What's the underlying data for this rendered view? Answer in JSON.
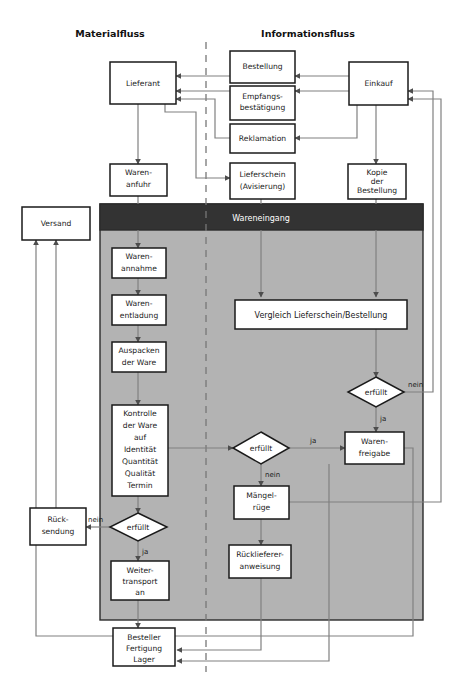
{
  "figure": {
    "type": "flowchart",
    "language": "de",
    "title_left": "Materialfluss",
    "title_right": "Informationsfluss",
    "swimlane_title": "Wareneingang",
    "colors": {
      "lane_header_fill": "#333333",
      "lane_header_text": "#ffffff",
      "lane_body_fill": "#b3b3b3",
      "node_fill": "#ffffff",
      "node_stroke": "#1a1a1a",
      "connector_stroke": "#7f7f7f",
      "page_background": "#ffffff"
    }
  },
  "columns": {
    "left": {
      "label": "Materialfluss"
    },
    "right": {
      "label": "Informationsfluss"
    }
  },
  "lane": {
    "label": "Wareneingang"
  },
  "nodes": [
    {
      "id": "lieferant",
      "label": "Lieferant",
      "shape": "box"
    },
    {
      "id": "warenanfuhr",
      "label": "Waren-\nanfuhr",
      "shape": "box"
    },
    {
      "id": "versand",
      "label": "Versand",
      "shape": "box"
    },
    {
      "id": "bestellung",
      "label": "Bestellung",
      "shape": "box"
    },
    {
      "id": "empfang",
      "label": "Empfangs-\nbestätigung",
      "shape": "box"
    },
    {
      "id": "reklamation",
      "label": "Reklamation",
      "shape": "box"
    },
    {
      "id": "lieferschein",
      "label": "Lieferschein\n(Avisierung)",
      "shape": "box"
    },
    {
      "id": "einkauf",
      "label": "Einkauf",
      "shape": "box"
    },
    {
      "id": "kopie",
      "label": "Kopie\nder\nBestellung",
      "shape": "box"
    },
    {
      "id": "warenannahme",
      "label": "Waren-\nannahme",
      "shape": "box"
    },
    {
      "id": "warenentladung",
      "label": "Waren-\nentladung",
      "shape": "box"
    },
    {
      "id": "auspacken",
      "label": "Auspacken\nder Ware",
      "shape": "box"
    },
    {
      "id": "kontrolle",
      "label": "Kontrolle\nder Ware\nauf\nIdentität\nQuantität\nQualität\nTermin",
      "shape": "box"
    },
    {
      "id": "vergleich",
      "label": "Vergleich Lieferschein/Bestellung",
      "shape": "box"
    },
    {
      "id": "erfuellt_oben",
      "label": "erfüllt",
      "shape": "diamond"
    },
    {
      "id": "erfuellt_mitte",
      "label": "erfüllt",
      "shape": "diamond"
    },
    {
      "id": "erfuellt_links",
      "label": "erfüllt",
      "shape": "diamond"
    },
    {
      "id": "warenfreigabe",
      "label": "Waren-\nfreigabe",
      "shape": "box"
    },
    {
      "id": "maengelruege",
      "label": "Mängel-\nrüge",
      "shape": "box"
    },
    {
      "id": "rucklieferung",
      "label": "Rücklieferer-\nanweisung",
      "shape": "box"
    },
    {
      "id": "ruecksendung",
      "label": "Rück-\nsendung",
      "shape": "box"
    },
    {
      "id": "weitertransport",
      "label": "Weiter-\ntransport\nan",
      "shape": "box"
    },
    {
      "id": "besteller",
      "label": "Besteller\nFertigung\nLager",
      "shape": "box"
    }
  ],
  "node_text": {
    "lieferant": "Lieferant",
    "warenanfuhr_1": "Waren-",
    "warenanfuhr_2": "anfuhr",
    "versand": "Versand",
    "bestellung": "Bestellung",
    "empfang_1": "Empfangs-",
    "empfang_2": "bestätigung",
    "reklamation": "Reklamation",
    "lieferschein_1": "Lieferschein",
    "lieferschein_2": "(Avisierung)",
    "einkauf": "Einkauf",
    "kopie_1": "Kopie",
    "kopie_2": "der",
    "kopie_3": "Bestellung",
    "warenannahme_1": "Waren-",
    "warenannahme_2": "annahme",
    "warenentladung_1": "Waren-",
    "warenentladung_2": "entladung",
    "auspacken_1": "Auspacken",
    "auspacken_2": "der Ware",
    "kontrolle_1": "Kontrolle",
    "kontrolle_2": "der Ware",
    "kontrolle_3": "auf",
    "kontrolle_4": "Identität",
    "kontrolle_5": "Quantität",
    "kontrolle_6": "Qualität",
    "kontrolle_7": "Termin",
    "vergleich": "Vergleich Lieferschein/Bestellung",
    "erfuellt_oben": "erfüllt",
    "erfuellt_mitte": "erfüllt",
    "erfuellt_links": "erfüllt",
    "warenfreigabe_1": "Waren-",
    "warenfreigabe_2": "freigabe",
    "maengelruege_1": "Mängel-",
    "maengelruege_2": "rüge",
    "rucklieferung_1": "Rücklieferer-",
    "rucklieferung_2": "anweisung",
    "ruecksendung_1": "Rück-",
    "ruecksendung_2": "sendung",
    "weitertransport_1": "Weiter-",
    "weitertransport_2": "transport",
    "weitertransport_3": "an",
    "besteller_1": "Besteller",
    "besteller_2": "Fertigung",
    "besteller_3": "Lager"
  },
  "edge_labels": {
    "oben_nein": "nein",
    "oben_ja": "ja",
    "mitte_ja": "ja",
    "mitte_nein": "nein",
    "links_nein": "nein",
    "links_ja": "ja"
  },
  "edges": [
    {
      "from": "einkauf",
      "to": "bestellung",
      "label": ""
    },
    {
      "from": "bestellung",
      "to": "lieferant",
      "label": ""
    },
    {
      "from": "lieferant",
      "to": "empfang",
      "label": ""
    },
    {
      "from": "empfang",
      "to": "einkauf",
      "label": ""
    },
    {
      "from": "einkauf",
      "to": "reklamation",
      "label": ""
    },
    {
      "from": "reklamation",
      "to": "lieferant",
      "label": ""
    },
    {
      "from": "lieferant",
      "to": "lieferschein",
      "label": ""
    },
    {
      "from": "lieferant",
      "to": "warenanfuhr",
      "label": ""
    },
    {
      "from": "einkauf",
      "to": "kopie",
      "label": ""
    },
    {
      "from": "warenanfuhr",
      "to": "warenannahme",
      "label": ""
    },
    {
      "from": "lieferschein",
      "to": "vergleich",
      "label": ""
    },
    {
      "from": "kopie",
      "to": "vergleich",
      "label": ""
    },
    {
      "from": "warenannahme",
      "to": "warenentladung",
      "label": ""
    },
    {
      "from": "warenentladung",
      "to": "auspacken",
      "label": ""
    },
    {
      "from": "auspacken",
      "to": "kontrolle",
      "label": ""
    },
    {
      "from": "vergleich",
      "to": "erfuellt_oben",
      "label": ""
    },
    {
      "from": "erfuellt_oben",
      "to": "einkauf",
      "label": "nein"
    },
    {
      "from": "erfuellt_oben",
      "to": "warenfreigabe",
      "label": "ja"
    },
    {
      "from": "kontrolle",
      "to": "erfuellt_mitte",
      "label": ""
    },
    {
      "from": "erfuellt_mitte",
      "to": "warenfreigabe",
      "label": "ja"
    },
    {
      "from": "erfuellt_mitte",
      "to": "maengelruege",
      "label": "nein"
    },
    {
      "from": "maengelruege",
      "to": "einkauf",
      "label": ""
    },
    {
      "from": "maengelruege",
      "to": "rucklieferung",
      "label": ""
    },
    {
      "from": "rucklieferung",
      "to": "besteller",
      "label": ""
    },
    {
      "from": "kontrolle",
      "to": "erfuellt_links",
      "label": ""
    },
    {
      "from": "erfuellt_links",
      "to": "ruecksendung",
      "label": "nein"
    },
    {
      "from": "erfuellt_links",
      "to": "weitertransport",
      "label": "ja"
    },
    {
      "from": "ruecksendung",
      "to": "versand",
      "label": ""
    },
    {
      "from": "weitertransport",
      "to": "besteller",
      "label": ""
    },
    {
      "from": "warenfreigabe",
      "to": "besteller",
      "label": ""
    },
    {
      "from": "warenfreigabe",
      "to": "versand",
      "label": ""
    }
  ]
}
